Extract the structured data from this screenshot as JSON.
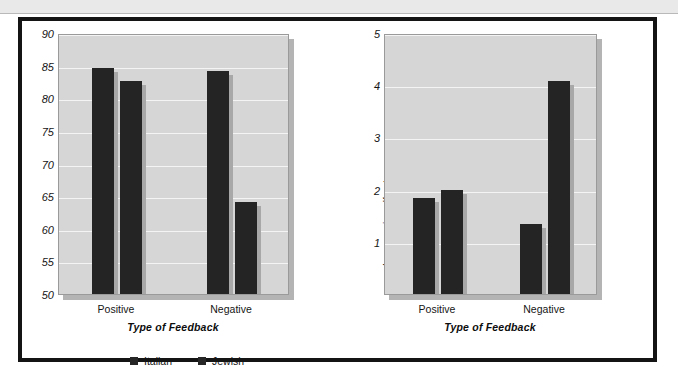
{
  "chart_data": [
    {
      "type": "bar",
      "panel": "left",
      "title": "",
      "xlabel": "Type of Feedback",
      "ylabel": "Rating of target",
      "categories": [
        "Positive",
        "Negative"
      ],
      "series": [
        {
          "name": "Italian",
          "values": [
            85.0,
            84.5
          ]
        },
        {
          "name": "Jewish",
          "values": [
            83.0,
            64.4
          ]
        }
      ],
      "ylim": [
        50,
        90
      ],
      "yticks": [
        50,
        55,
        60,
        65,
        70,
        75,
        80,
        85,
        90
      ],
      "ytick_labels": [
        "50",
        "55",
        "60",
        "65",
        "70",
        "75",
        "80",
        "85",
        "90"
      ],
      "grid": true,
      "legend_position": "bottom-left",
      "bar_color": "#242424",
      "plot_background": "#d6d6d6",
      "gridline_color": "#f4f4f4"
    },
    {
      "type": "bar",
      "panel": "right",
      "title": "",
      "xlabel": "Type of Feedback",
      "ylabel": "Increase in self-esteem",
      "categories": [
        "Positive",
        "Negative"
      ],
      "series": [
        {
          "name": "Italian",
          "values": [
            1.87,
            1.38
          ]
        },
        {
          "name": "Jewish",
          "values": [
            2.03,
            4.12
          ]
        }
      ],
      "ylim": [
        0,
        5
      ],
      "yticks": [
        1,
        2,
        3,
        4,
        5
      ],
      "ytick_labels": [
        "1",
        "2",
        "3",
        "4",
        "5"
      ],
      "grid": true,
      "legend_position": "none",
      "bar_color": "#242424",
      "plot_background": "#d6d6d6",
      "gridline_color": "#f4f4f4"
    }
  ],
  "legend": {
    "items": [
      {
        "label": "Italian",
        "color": "#262626"
      },
      {
        "label": "Jewish",
        "color": "#262626"
      }
    ]
  }
}
